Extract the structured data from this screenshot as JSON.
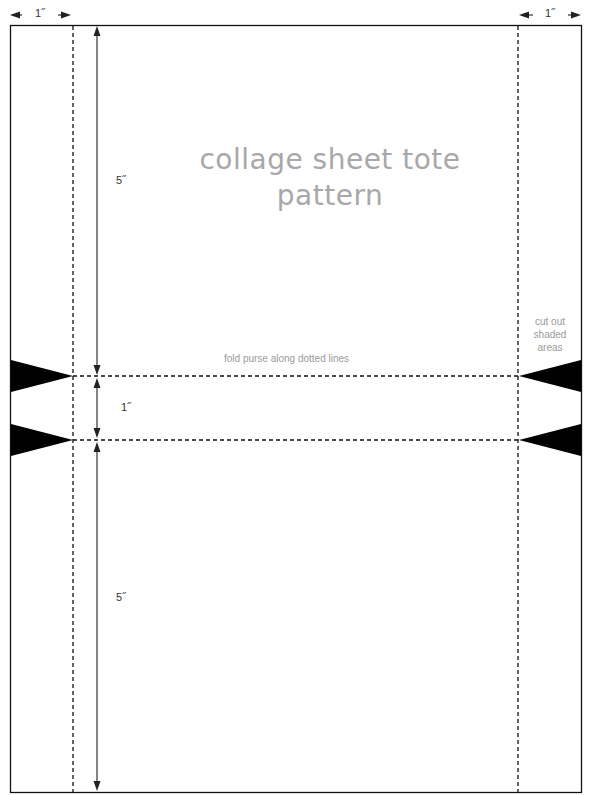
{
  "title": {
    "line1": "collage sheet tote",
    "line2": "pattern"
  },
  "dimensions": {
    "left_margin": "1˝",
    "right_margin": "1˝",
    "top_section": "5˝",
    "middle_section": "1˝",
    "bottom_section": "5˝"
  },
  "notes": {
    "fold": "fold purse along dotted lines",
    "cut_line1": "cut out",
    "cut_line2": "shaded",
    "cut_line3": "areas"
  },
  "colors": {
    "line": "#000000",
    "title": "#a8a8a8",
    "note": "#9a9a9a"
  }
}
